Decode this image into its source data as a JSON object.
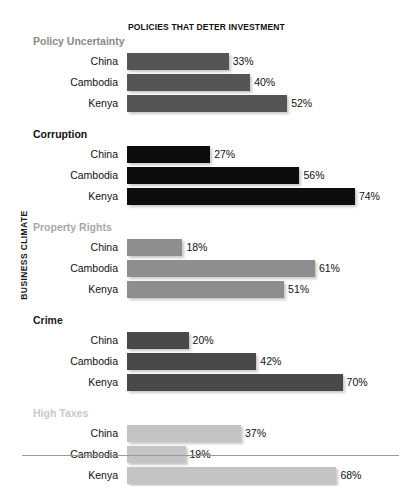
{
  "chart_data": {
    "type": "bar",
    "title": "POLICIES THAT DETER INVESTMENT",
    "xlabel": "",
    "ylabel": "BUSINESS CLIMATE",
    "orientation": "horizontal",
    "xlim": [
      0,
      80
    ],
    "grid": false,
    "legend": "none",
    "value_suffix": "%",
    "categories": [
      "China",
      "Cambodia",
      "Kenya"
    ],
    "groups": [
      {
        "name": "Policy Uncertainty",
        "color": "#555555",
        "header_color": "#8a8a8a",
        "values": [
          33,
          40,
          52
        ],
        "labels": [
          "33%",
          "40%",
          "52%"
        ]
      },
      {
        "name": "Corruption",
        "color": "#0d0d0d",
        "header_color": "#111111",
        "values": [
          27,
          56,
          74
        ],
        "labels": [
          "27%",
          "56%",
          "74%"
        ]
      },
      {
        "name": "Property Rights",
        "color": "#8e8e8e",
        "header_color": "#a8a8a8",
        "values": [
          18,
          61,
          51
        ],
        "labels": [
          "18%",
          "61%",
          "51%"
        ]
      },
      {
        "name": "Crime",
        "color": "#494949",
        "header_color": "#1a1a1a",
        "values": [
          20,
          42,
          70
        ],
        "labels": [
          "20%",
          "42%",
          "70%"
        ]
      },
      {
        "name": "High Taxes",
        "color": "#c4c4c4",
        "header_color": "#c9c9c9",
        "values": [
          37,
          19,
          68
        ],
        "labels": [
          "37%",
          "19%",
          "68%"
        ]
      }
    ]
  },
  "layout": {
    "px_per_percent": 3.08,
    "background": "#ffffff",
    "rule_color": "#9a9a9a"
  }
}
